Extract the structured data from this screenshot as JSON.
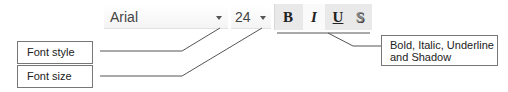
{
  "toolbar": {
    "font_family": {
      "value": "Arial",
      "dropdown_icon": "chevron-down-icon"
    },
    "font_size": {
      "value": "24",
      "dropdown_icon": "chevron-down-icon"
    },
    "buttons": [
      {
        "label": "B",
        "name": "bold",
        "pressed": false
      },
      {
        "label": "I",
        "name": "italic",
        "pressed": true
      },
      {
        "label": "U",
        "name": "underline",
        "pressed": false
      },
      {
        "label": "S",
        "name": "shadow",
        "pressed": false
      }
    ]
  },
  "callouts": {
    "font_style": "Font style",
    "font_size": "Font size",
    "format_buttons_line1": "Bold, Italic, Underline",
    "format_buttons_line2": "and Shadow"
  },
  "colors": {
    "line": "#555555",
    "toolbar_bg": "#e9e9e9",
    "box_border": "#777777"
  }
}
